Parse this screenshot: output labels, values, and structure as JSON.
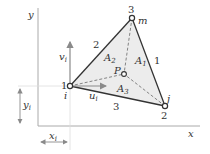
{
  "axes": {
    "x_label": "x",
    "y_label": "y"
  },
  "vertices": {
    "i": {
      "number": "1",
      "name": "i"
    },
    "j": {
      "number": "2",
      "name": "j"
    },
    "m": {
      "number": "3",
      "name": "m"
    }
  },
  "edges": {
    "edge_1": "1",
    "edge_2": "2",
    "edge_3": "3"
  },
  "interior_point": "P",
  "areas": {
    "a1": "A",
    "a1_sub": "1",
    "a2": "A",
    "a2_sub": "2",
    "a3": "A",
    "a3_sub": "3"
  },
  "displacements": {
    "u": "u",
    "u_sub": "i",
    "v": "v",
    "v_sub": "i"
  },
  "coordinates": {
    "x": "x",
    "x_sub": "i",
    "y": "y",
    "y_sub": "i"
  },
  "colors": {
    "fill": "#ececec",
    "edge": "#333333",
    "axis": "#aaaaaa",
    "dim": "#8a8a8a"
  }
}
